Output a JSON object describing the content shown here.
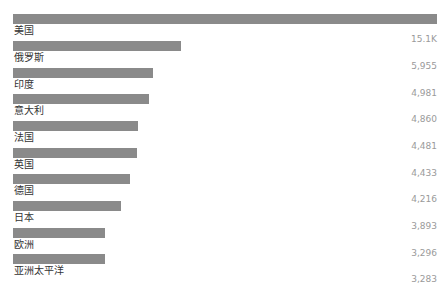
{
  "chart_data": {
    "type": "bar",
    "orientation": "horizontal",
    "title": "",
    "xlabel": "",
    "ylabel": "",
    "grid": false,
    "legend": null,
    "bar_color": "#8a8a8a",
    "categories": [
      "美国",
      "俄罗斯",
      "印度",
      "意大利",
      "法国",
      "英国",
      "德国",
      "日本",
      "欧洲",
      "亚洲太平洋"
    ],
    "values": [
      15100,
      5955,
      4981,
      4860,
      4481,
      4433,
      4216,
      3893,
      3296,
      3283
    ],
    "value_labels": [
      "15.1K",
      "5,955",
      "4,981",
      "4,860",
      "4,481",
      "4,433",
      "4,216",
      "3,893",
      "3,296",
      "3,283"
    ],
    "xlim": [
      0,
      15100
    ]
  },
  "rows": [
    {
      "label": "美国",
      "value_label": "15.1K",
      "bar_width": 424
    },
    {
      "label": "俄罗斯",
      "value_label": "5,955",
      "bar_width": 168
    },
    {
      "label": "印度",
      "value_label": "4,981",
      "bar_width": 140
    },
    {
      "label": "意大利",
      "value_label": "4,860",
      "bar_width": 136
    },
    {
      "label": "法国",
      "value_label": "4,481",
      "bar_width": 125
    },
    {
      "label": "英国",
      "value_label": "4,433",
      "bar_width": 124
    },
    {
      "label": "德国",
      "value_label": "4,216",
      "bar_width": 117
    },
    {
      "label": "日本",
      "value_label": "3,893",
      "bar_width": 108
    },
    {
      "label": "欧洲",
      "value_label": "3,296",
      "bar_width": 92
    },
    {
      "label": "亚洲太平洋",
      "value_label": "3,283",
      "bar_width": 92
    }
  ]
}
